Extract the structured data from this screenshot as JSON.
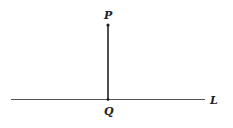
{
  "diagram": {
    "point_p": {
      "label": "P",
      "x": 108,
      "y": 25
    },
    "point_q": {
      "label": "Q",
      "x": 108,
      "y": 99
    },
    "line_l": {
      "label": "L",
      "x1": 11,
      "x2": 205,
      "y": 99
    },
    "colors": {
      "stroke": "#333333",
      "background": "#ffffff"
    }
  }
}
